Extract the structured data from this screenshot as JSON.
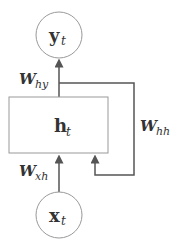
{
  "diagram": {
    "nodes": {
      "output": {
        "symbol": "y",
        "subscript": "t"
      },
      "hidden": {
        "symbol": "h",
        "subscript": "t"
      },
      "input": {
        "symbol": "x",
        "subscript": "t"
      }
    },
    "edges": {
      "hidden_to_output": {
        "weight": "W",
        "subscript": "hy"
      },
      "input_to_hidden": {
        "weight": "W",
        "subscript": "xh"
      },
      "hidden_to_hidden": {
        "weight": "W",
        "subscript": "hh"
      }
    },
    "colors": {
      "stroke": "#555555",
      "node_stroke": "#999999",
      "text": "#333333"
    }
  }
}
